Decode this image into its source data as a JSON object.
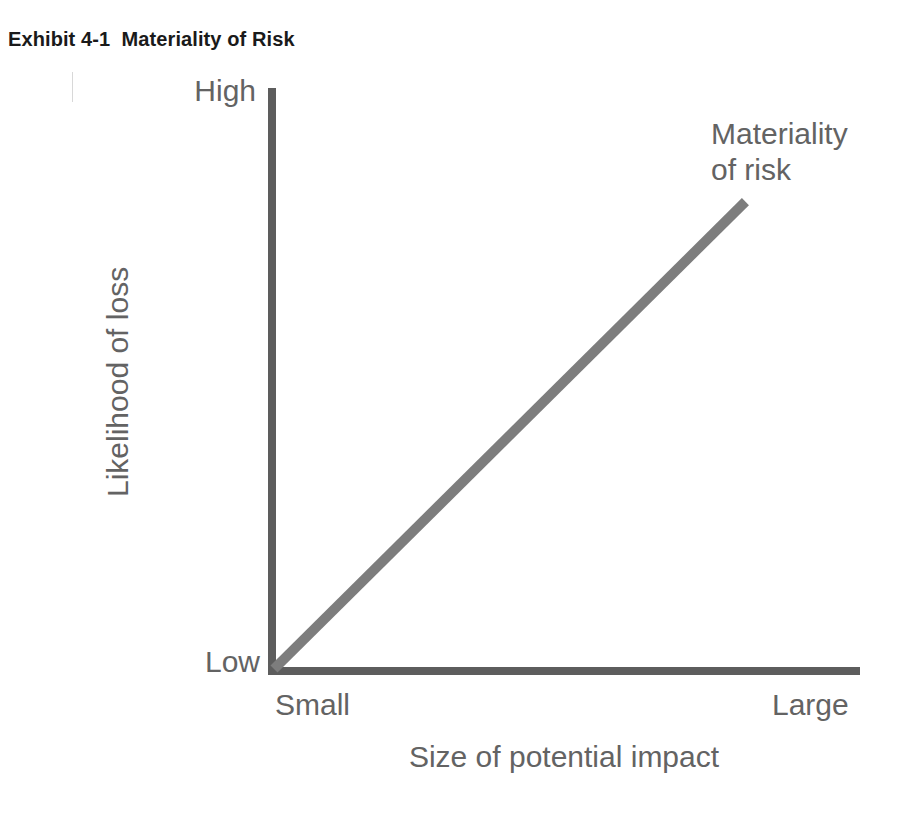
{
  "exhibit": {
    "title": "Exhibit 4-1  Materiality of Risk"
  },
  "chart_data": {
    "type": "line",
    "title": "Exhibit 4-1  Materiality of Risk",
    "xlabel": "Size of potential impact",
    "ylabel": "Likelihood of loss",
    "x_tick_labels": [
      "Small",
      "Large"
    ],
    "y_tick_labels": [
      "Low",
      "High"
    ],
    "xlim": [
      0,
      1
    ],
    "ylim": [
      0,
      1
    ],
    "grid": false,
    "legend_position": "none",
    "series": [
      {
        "name": "Materiality of risk",
        "annotation": "Materiality\nof risk",
        "annotation_line1": "Materiality",
        "annotation_line2": "of risk",
        "color": "#7d7d7d",
        "line_width": 10,
        "x": [
          0,
          1
        ],
        "y": [
          0,
          1
        ],
        "points": [
          {
            "x": 0,
            "y": 0,
            "x_label": "Small",
            "y_label": "Low"
          },
          {
            "x": 0.81,
            "y": 0.81,
            "x_label": "Large",
            "y_label": "High"
          }
        ]
      }
    ],
    "axis_color": "#5d5d5d",
    "background_color": "#ffffff"
  },
  "labels": {
    "y_high": "High",
    "y_low": "Low",
    "x_small": "Small",
    "x_large": "Large",
    "y_title": "Likelihood of loss",
    "x_title": "Size of potential impact",
    "series_line1": "Materiality",
    "series_line2": "of risk"
  }
}
